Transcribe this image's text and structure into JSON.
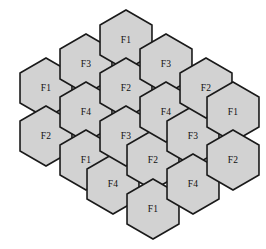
{
  "figure": {
    "name": "hexagonal-cell-grid",
    "width": 266,
    "height": 249,
    "background_color": "#ffffff"
  },
  "style": {
    "cell_fill": "#d2d2d2",
    "cell_stroke": "#1a1a1a",
    "label_color": "#101010"
  },
  "geometry": {
    "orientation": "pointy-top",
    "hex_radius": 30,
    "column_x": [
      48,
      75,
      129,
      183,
      210
    ],
    "column_step_x": 27,
    "row_step_y": 47,
    "columns": [
      {
        "x": 48,
        "count": 3,
        "y_start": 84
      },
      {
        "x": 75,
        "count": 4,
        "y_start": 60
      },
      {
        "x": 129,
        "count": 4,
        "y_start": 36
      },
      {
        "x": 183,
        "count": 4,
        "y_start": 60
      },
      {
        "x": 210,
        "count": 3,
        "y_start": 84
      }
    ]
  },
  "cells": [
    {
      "id": "c-1-1",
      "label": "F1",
      "cx": 46,
      "cy": 88,
      "column": 1,
      "row": 1
    },
    {
      "id": "c-1-2",
      "label": "F2",
      "cx": 46,
      "cy": 136,
      "column": 1,
      "row": 2
    },
    {
      "id": "c-2-1",
      "label": "F3",
      "cx": 86,
      "cy": 64,
      "column": 2,
      "row": 1
    },
    {
      "id": "c-2-2",
      "label": "F4",
      "cx": 86,
      "cy": 112,
      "column": 2,
      "row": 2
    },
    {
      "id": "c-2-3",
      "label": "F1",
      "cx": 86,
      "cy": 160,
      "column": 2,
      "row": 3
    },
    {
      "id": "c-2-4",
      "label": "F4",
      "cx": 113,
      "cy": 184,
      "column": 2,
      "row": 4
    },
    {
      "id": "c-3-1",
      "label": "F1",
      "cx": 126,
      "cy": 40,
      "column": 3,
      "row": 1
    },
    {
      "id": "c-3-2",
      "label": "F2",
      "cx": 126,
      "cy": 88,
      "column": 3,
      "row": 2
    },
    {
      "id": "c-3-3",
      "label": "F3",
      "cx": 126,
      "cy": 136,
      "column": 3,
      "row": 3
    },
    {
      "id": "c-3-4",
      "label": "F2",
      "cx": 153,
      "cy": 160,
      "column": 3,
      "row": 4
    },
    {
      "id": "c-3-5",
      "label": "F1",
      "cx": 153,
      "cy": 209,
      "column": 3,
      "row": 5
    },
    {
      "id": "c-4-1",
      "label": "F3",
      "cx": 166,
      "cy": 64,
      "column": 4,
      "row": 1
    },
    {
      "id": "c-4-2",
      "label": "F4",
      "cx": 166,
      "cy": 112,
      "column": 4,
      "row": 2
    },
    {
      "id": "c-4-3",
      "label": "F3",
      "cx": 193,
      "cy": 136,
      "column": 4,
      "row": 3
    },
    {
      "id": "c-4-4",
      "label": "F4",
      "cx": 193,
      "cy": 184,
      "column": 4,
      "row": 4
    },
    {
      "id": "c-5-1",
      "label": "F2",
      "cx": 206,
      "cy": 88,
      "column": 5,
      "row": 1
    },
    {
      "id": "c-5-2",
      "label": "F1",
      "cx": 233,
      "cy": 112,
      "column": 5,
      "row": 2
    },
    {
      "id": "c-5-3",
      "label": "F2",
      "cx": 233,
      "cy": 160,
      "column": 5,
      "row": 3
    }
  ],
  "legend_values": [
    "F1",
    "F2",
    "F3",
    "F4"
  ]
}
